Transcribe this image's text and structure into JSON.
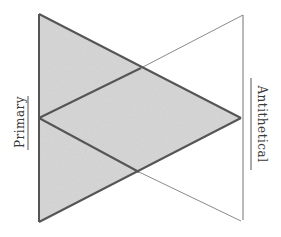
{
  "diagram": {
    "type": "interlocking-cones",
    "labels": {
      "primary": "Primary",
      "antithetical": "Antithetical"
    },
    "colors": {
      "background": "#ffffff",
      "shaded_fill": "#d8d8d8",
      "stroke_dark": "#555555",
      "stroke_light": "#8a8a8a",
      "label_text": "#3a3a3a"
    },
    "shapes": {
      "primary_cone": {
        "description": "Shaded triangle with base on the left edge and apex at the right middle",
        "points": [
          [
            39,
            14
          ],
          [
            39,
            222
          ],
          [
            241,
            118
          ]
        ]
      },
      "antithetical_cone": {
        "description": "Unshaded triangle with base on the right edge and apex at the left middle",
        "points": [
          [
            243,
            15
          ],
          [
            243,
            220
          ],
          [
            39,
            118
          ]
        ]
      },
      "crossings": {
        "upper": [
          141,
          68
        ],
        "lower": [
          139,
          172
        ]
      }
    }
  }
}
